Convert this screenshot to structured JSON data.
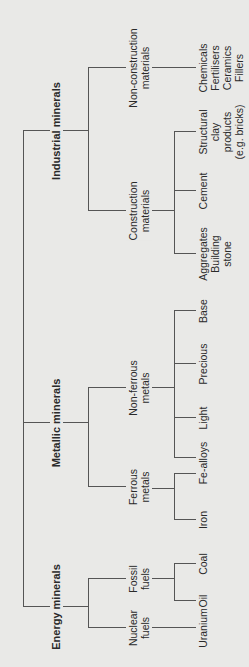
{
  "diagram": {
    "colors": {
      "background": "#e9e9e7",
      "lines": "#555555",
      "text": "#2a2a2a"
    },
    "categories": [
      {
        "label": "Energy minerals",
        "children": [
          {
            "label_lines": [
              "Nuclear",
              "fuels"
            ],
            "leaves": [
              {
                "lines": [
                  "Uranium"
                ]
              }
            ]
          },
          {
            "label_lines": [
              "Fossil",
              "fuels"
            ],
            "leaves": [
              {
                "lines": [
                  "Oil"
                ]
              },
              {
                "lines": [
                  "Coal"
                ]
              }
            ]
          }
        ]
      },
      {
        "label": "Metallic minerals",
        "children": [
          {
            "label_lines": [
              "Ferrous",
              "metals"
            ],
            "leaves": [
              {
                "lines": [
                  "Iron"
                ]
              },
              {
                "lines": [
                  "Fe-alloys"
                ]
              }
            ]
          },
          {
            "label_lines": [
              "Non-ferrous",
              "metals"
            ],
            "leaves": [
              {
                "lines": [
                  "Light"
                ]
              },
              {
                "lines": [
                  "Precious"
                ]
              },
              {
                "lines": [
                  "Base"
                ]
              }
            ]
          }
        ]
      },
      {
        "label": "Industrial minerals",
        "children": [
          {
            "label_lines": [
              "Construction",
              "materials"
            ],
            "leaves": [
              {
                "lines": [
                  "Aggregates",
                  "Building",
                  "stone"
                ]
              },
              {
                "lines": [
                  "Cement"
                ]
              },
              {
                "lines": [
                  "Structural",
                  "clay",
                  "products",
                  "(e.g. bricks)"
                ]
              }
            ]
          },
          {
            "label_lines": [
              "Non-construction",
              "materials"
            ],
            "leaves": [
              {
                "lines": [
                  "Chemicals",
                  "Fertilisers",
                  "Ceramics",
                  "Fillers"
                ]
              }
            ]
          }
        ]
      }
    ]
  }
}
